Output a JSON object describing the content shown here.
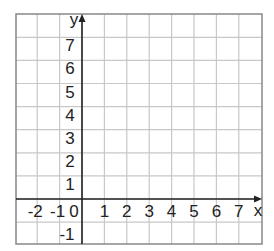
{
  "chart_data": {
    "type": "coordinate-grid",
    "title": "",
    "xlabel": "x",
    "ylabel": "y",
    "xlim": [
      -3,
      8
    ],
    "ylim": [
      -2,
      8
    ],
    "grid": true,
    "x_ticks": [
      {
        "value": -2,
        "label": "-2"
      },
      {
        "value": -1,
        "label": "-1"
      },
      {
        "value": 1,
        "label": "1"
      },
      {
        "value": 2,
        "label": "2"
      },
      {
        "value": 3,
        "label": "3"
      },
      {
        "value": 4,
        "label": "4"
      },
      {
        "value": 5,
        "label": "5"
      },
      {
        "value": 6,
        "label": "6"
      },
      {
        "value": 7,
        "label": "7"
      }
    ],
    "y_ticks": [
      {
        "value": 7,
        "label": "7"
      },
      {
        "value": 6,
        "label": "6"
      },
      {
        "value": 5,
        "label": "5"
      },
      {
        "value": 4,
        "label": "4"
      },
      {
        "value": 3,
        "label": "3"
      },
      {
        "value": 2,
        "label": "2"
      },
      {
        "value": 1,
        "label": "1"
      },
      {
        "value": -1,
        "label": "-1"
      }
    ],
    "origin_label": "0",
    "series": []
  },
  "colors": {
    "grid": "#c8c8c8",
    "border": "#888888",
    "axis": "#222222",
    "text": "#222222"
  },
  "layout": {
    "x0": 16,
    "x1": 262,
    "y0": 14,
    "y1": 244,
    "origin_px": [
      82,
      199
    ],
    "cell_w": 22.4,
    "cell_h": 23.1
  }
}
